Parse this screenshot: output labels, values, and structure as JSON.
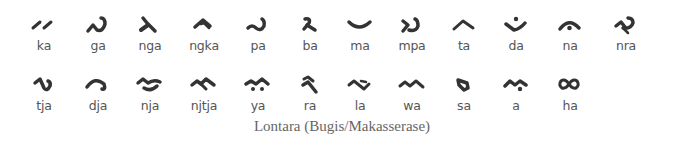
{
  "title": "Lontara (Bugis/Makasserase)",
  "rows": [
    [
      {
        "label": "ka",
        "glyph": "ka-glyph"
      },
      {
        "label": "ga",
        "glyph": "ga-glyph"
      },
      {
        "label": "nga",
        "glyph": "nga-glyph"
      },
      {
        "label": "ngka",
        "glyph": "ngka-glyph"
      },
      {
        "label": "pa",
        "glyph": "pa-glyph"
      },
      {
        "label": "ba",
        "glyph": "ba-glyph"
      },
      {
        "label": "ma",
        "glyph": "ma-glyph"
      },
      {
        "label": "mpa",
        "glyph": "mpa-glyph"
      },
      {
        "label": "ta",
        "glyph": "ta-glyph"
      },
      {
        "label": "da",
        "glyph": "da-glyph"
      },
      {
        "label": "na",
        "glyph": "na-glyph"
      },
      {
        "label": "nra",
        "glyph": "nra-glyph"
      }
    ],
    [
      {
        "label": "tja",
        "glyph": "tja-glyph"
      },
      {
        "label": "dja",
        "glyph": "dja-glyph"
      },
      {
        "label": "nja",
        "glyph": "nja-glyph"
      },
      {
        "label": "njtja",
        "glyph": "njtja-glyph"
      },
      {
        "label": "ya",
        "glyph": "ya-glyph"
      },
      {
        "label": "ra",
        "glyph": "ra-glyph"
      },
      {
        "label": "la",
        "glyph": "la-glyph"
      },
      {
        "label": "wa",
        "glyph": "wa-glyph"
      },
      {
        "label": "sa",
        "glyph": "sa-glyph"
      },
      {
        "label": "a",
        "glyph": "a-glyph"
      },
      {
        "label": "ha",
        "glyph": "ha-glyph"
      }
    ]
  ],
  "colors": {
    "glyph": "#333333",
    "label": "#555555",
    "caption": "#666666"
  }
}
